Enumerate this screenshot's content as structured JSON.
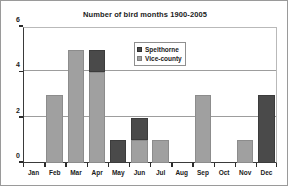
{
  "chart_data": {
    "type": "bar",
    "title": "Number of bird months 1900-2005",
    "xlabel": "",
    "ylabel": "",
    "ylim": [
      0,
      6
    ],
    "yticks": [
      0,
      2,
      4,
      6
    ],
    "grid": true,
    "stacked": true,
    "legend_position": "inside-top-right",
    "categories": [
      "Jan",
      "Feb",
      "Mar",
      "Apr",
      "May",
      "Jun",
      "Jul",
      "Aug",
      "Sep",
      "Oct",
      "Nov",
      "Dec"
    ],
    "series": [
      {
        "name": "Vice-county",
        "color": "#a0a0a0",
        "values": [
          0,
          3,
          5,
          4,
          0,
          1,
          1,
          0,
          3,
          0,
          1,
          0
        ]
      },
      {
        "name": "Spelthorne",
        "color": "#4a4a4a",
        "values": [
          0,
          0,
          0,
          1,
          1,
          1,
          0,
          0,
          0,
          0,
          0,
          3
        ]
      }
    ],
    "totals": [
      0,
      3,
      5,
      5,
      1,
      2,
      1,
      0,
      3,
      0,
      1,
      3
    ]
  },
  "legend": {
    "items": [
      {
        "label": "Spelthorne",
        "swatch": "spel"
      },
      {
        "label": "Vice-county",
        "swatch": "vice"
      }
    ]
  }
}
